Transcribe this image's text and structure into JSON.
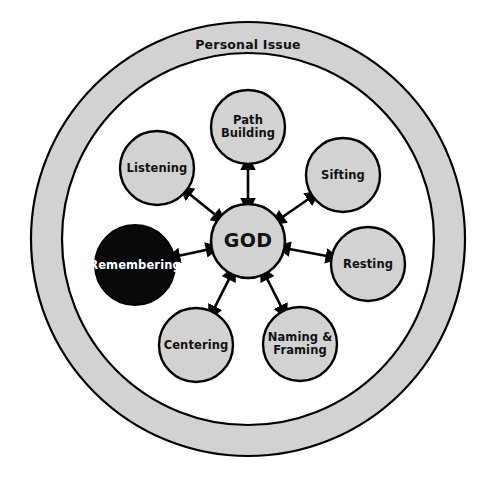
{
  "diagram": {
    "type": "radial-hub-and-spoke",
    "background_color": "#ffffff",
    "title": "",
    "outer_ring": {
      "label": "Personal Issue",
      "fill_color": "#d2d2d2",
      "stroke_color": "#000000",
      "center": {
        "x": 248,
        "y": 239
      },
      "outer_radius": 217,
      "inner_radius": 186,
      "label_position": {
        "x": 248,
        "y": 45
      }
    },
    "center_node": {
      "id": "god",
      "label": "GOD",
      "lines": [
        "GOD"
      ],
      "center": {
        "x": 248,
        "y": 241
      },
      "radius": 37,
      "fill_color": "#d2d2d2",
      "text_color": "#111111",
      "highlighted": false
    },
    "connector_style": {
      "arrowheads": "both",
      "stroke_color": "#000000",
      "stroke_width": 2.6
    },
    "satellite_nodes": [
      {
        "id": "path-building",
        "label": "Path Building",
        "lines": [
          "Path",
          "Building"
        ],
        "center": {
          "x": 248,
          "y": 127
        },
        "radius": 37,
        "fill_color": "#d2d2d2",
        "text_color": "#111111",
        "highlighted": false
      },
      {
        "id": "sifting",
        "label": "Sifting",
        "lines": [
          "Sifting"
        ],
        "center": {
          "x": 343,
          "y": 175
        },
        "radius": 37,
        "fill_color": "#d2d2d2",
        "text_color": "#111111",
        "highlighted": false
      },
      {
        "id": "resting",
        "label": "Resting",
        "lines": [
          "Resting"
        ],
        "center": {
          "x": 368,
          "y": 264
        },
        "radius": 37,
        "fill_color": "#d2d2d2",
        "text_color": "#111111",
        "highlighted": false
      },
      {
        "id": "naming-framing",
        "label": "Naming & Framing",
        "lines": [
          "Naming &",
          "Framing"
        ],
        "center": {
          "x": 300,
          "y": 344
        },
        "radius": 37,
        "fill_color": "#d2d2d2",
        "text_color": "#111111",
        "highlighted": false
      },
      {
        "id": "centering",
        "label": "Centering",
        "lines": [
          "Centering"
        ],
        "center": {
          "x": 196,
          "y": 345
        },
        "radius": 37,
        "fill_color": "#d2d2d2",
        "text_color": "#111111",
        "highlighted": false
      },
      {
        "id": "remembering",
        "label": "Remembering",
        "lines": [
          "Remembering"
        ],
        "center": {
          "x": 135,
          "y": 265
        },
        "radius": 40,
        "fill_color": "#090909",
        "text_color": "#ffffff",
        "highlighted": true
      },
      {
        "id": "listening",
        "label": "Listening",
        "lines": [
          "Listening"
        ],
        "center": {
          "x": 157,
          "y": 168
        },
        "radius": 37,
        "fill_color": "#d2d2d2",
        "text_color": "#111111",
        "highlighted": false
      }
    ]
  },
  "chart_data": {
    "type": "diagram",
    "title": "Personal Issue",
    "hub": "GOD",
    "spokes": [
      "Path Building",
      "Sifting",
      "Resting",
      "Naming & Framing",
      "Centering",
      "Remembering",
      "Listening"
    ],
    "highlighted_spoke": "Remembering",
    "relation": "bidirectional"
  }
}
